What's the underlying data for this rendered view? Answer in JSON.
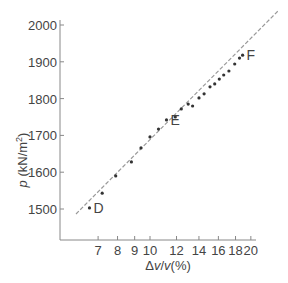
{
  "chart_data": {
    "type": "scatter",
    "title": "",
    "xlabel": "Δv/v(%)",
    "ylabel": "p (kN/m²)",
    "x_scale": "log",
    "xlim": [
      5.6,
      20.5
    ],
    "ylim": [
      1415,
      2000
    ],
    "x_ticks": [
      7,
      8,
      9,
      10,
      12,
      14,
      16,
      18,
      20
    ],
    "y_ticks": [
      1500,
      1600,
      1700,
      1800,
      1900,
      2000
    ],
    "grid": false,
    "legend": null,
    "series": [
      {
        "name": "measured",
        "marker": "dot",
        "x": [
          6.6,
          7.2,
          7.9,
          8.8,
          9.4,
          10.0,
          10.6,
          11.2,
          11.9,
          12.4,
          13.0,
          13.4,
          14.0,
          14.5,
          15.1,
          15.6,
          16.1,
          16.6,
          17.2,
          17.9,
          18.5,
          18.9
        ],
        "y": [
          1503,
          1543,
          1590,
          1628,
          1666,
          1696,
          1717,
          1742,
          1750,
          1772,
          1785,
          1780,
          1802,
          1813,
          1832,
          1840,
          1853,
          1864,
          1875,
          1894,
          1910,
          1918
        ]
      },
      {
        "name": "fit",
        "style": "dashed",
        "x": [
          6.1,
          22.0
        ],
        "y": [
          1490,
          1960
        ]
      }
    ],
    "annotations": [
      {
        "text": "D",
        "x": 6.6,
        "y": 1503
      },
      {
        "text": "E",
        "x": 11.2,
        "y": 1742
      },
      {
        "text": "F",
        "x": 18.9,
        "y": 1918
      }
    ]
  },
  "axes": {
    "x_title_prefix": "Δ",
    "x_title_var1": "v",
    "x_title_slash": "/",
    "x_title_var2": "v",
    "x_title_suffix": "(%)",
    "y_title_var": "p",
    "y_title_unit": " (kN/m",
    "y_title_sup": "2",
    "y_title_close": ")"
  }
}
